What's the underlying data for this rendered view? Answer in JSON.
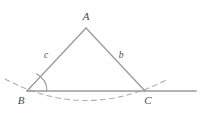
{
  "figure": {
    "name": "triangle-with-exterior-angle-arc",
    "width": 200,
    "height": 116,
    "background_color": "#ffffff",
    "stroke_color": "#9a9a9a",
    "dash_color": "#b0b0b0",
    "label_color": "#4a4a4a"
  },
  "vertices": [
    {
      "id": "A",
      "label": "A",
      "x": 86,
      "y": 28,
      "label_x": 86,
      "label_y": 17
    },
    {
      "id": "B",
      "label": "B",
      "x": 27,
      "y": 91,
      "label_x": 21,
      "label_y": 101
    },
    {
      "id": "C",
      "label": "C",
      "x": 145,
      "y": 91,
      "label_x": 148,
      "label_y": 101
    }
  ],
  "sides": [
    {
      "id": "c",
      "label": "c",
      "from": "B",
      "to": "A",
      "label_x": 46,
      "label_y": 56
    },
    {
      "id": "b",
      "label": "b",
      "from": "A",
      "to": "C",
      "label_x": 121,
      "label_y": 56
    },
    {
      "id": "a",
      "label": "",
      "from": "B",
      "to": "C",
      "label_x": 0,
      "label_y": 0
    }
  ],
  "baseline": {
    "name": "horizontal-base-line",
    "x1": 27,
    "y1": 91,
    "x2": 196,
    "y2": 91
  },
  "angle_arc": {
    "name": "angle-arc-at-B",
    "cx": 27,
    "cy": 91,
    "radius": 20,
    "path": "M 47 91 A 20 20 0 0 0 36.5 73.8"
  },
  "dashed_arc": {
    "name": "dashed-circular-arc",
    "path": "M 5 79 Q 86 122 168 79",
    "dash_pattern": "5 4"
  }
}
